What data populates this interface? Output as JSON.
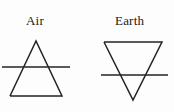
{
  "figure": {
    "background_color": "#fdfdfd",
    "stroke_color": "#232323",
    "text_color": "#1a1a1a",
    "width": 174,
    "height": 112
  },
  "symbols": [
    {
      "label": "Air",
      "icon_name": "air-alchemical-symbol",
      "description": "upward-pointing triangle crossed by a horizontal line",
      "triangle": {
        "orientation": "up",
        "apex": [
          36,
          41
        ],
        "base_left": [
          10,
          96
        ],
        "base_right": [
          62,
          96
        ]
      },
      "crossbar": {
        "x1": 2,
        "y1": 67,
        "x2": 70,
        "y2": 67
      },
      "label_position": [
        26,
        14
      ]
    },
    {
      "label": "Earth",
      "icon_name": "earth-alchemical-symbol",
      "description": "downward-pointing triangle crossed by a horizontal line",
      "triangle": {
        "orientation": "down",
        "top_left": [
          104,
          42
        ],
        "top_right": [
          162,
          42
        ],
        "apex": [
          133,
          100
        ]
      },
      "crossbar": {
        "x1": 101,
        "y1": 75,
        "x2": 168,
        "y2": 75
      },
      "label_position": [
        115,
        14
      ]
    }
  ]
}
